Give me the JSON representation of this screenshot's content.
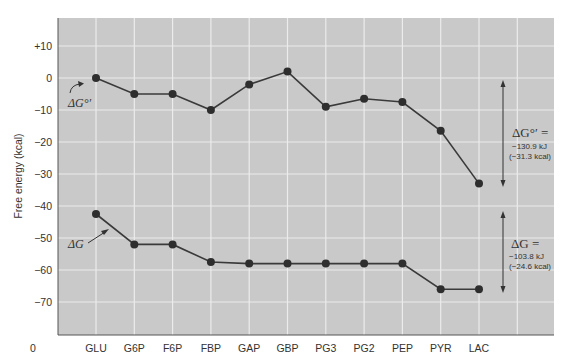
{
  "chart_data": {
    "type": "line",
    "title": "",
    "xlabel": "",
    "ylabel": "Free energy (kcal)",
    "origin_label": "0",
    "categories": [
      "GLU",
      "G6P",
      "F6P",
      "FBP",
      "GAP",
      "GBP",
      "PG3",
      "PG2",
      "PEP",
      "PYR",
      "LAC"
    ],
    "yticks": [
      {
        "value": 10,
        "label": "+10"
      },
      {
        "value": 0,
        "label": "0"
      },
      {
        "value": -10,
        "label": "−10"
      },
      {
        "value": -20,
        "label": "−20"
      },
      {
        "value": -30,
        "label": "−30"
      },
      {
        "value": -40,
        "label": "−40"
      },
      {
        "value": -50,
        "label": "−50"
      },
      {
        "value": -60,
        "label": "−60"
      },
      {
        "value": -70,
        "label": "−70"
      }
    ],
    "ylim": [
      -80,
      19
    ],
    "grid": true,
    "series": [
      {
        "name": "ΔG°′",
        "values": [
          0,
          -5,
          -5,
          -10,
          -2,
          2,
          -9,
          -6.5,
          -7.5,
          -16.5,
          -33
        ]
      },
      {
        "name": "ΔG",
        "values": [
          -42.5,
          -52,
          -52,
          -57.5,
          -58,
          -58,
          -58,
          -58,
          -58,
          -66,
          -66
        ]
      }
    ],
    "annotations": [
      {
        "id": "dg0",
        "symbol": "ΔG°′ =",
        "line1": "−130.9 kJ",
        "line2": "(−31.3 kcal)",
        "from": 0,
        "to": -33
      },
      {
        "id": "dg",
        "symbol": "ΔG =",
        "line1": "−103.8 kJ",
        "line2": "(−24.6 kcal)",
        "from": -42.5,
        "to": -66
      }
    ],
    "series_labels": {
      "dg0": "ΔG°′",
      "dg": "ΔG"
    }
  },
  "style": {
    "plot_bg": "#c9c9c9",
    "grid_color": "#ececec",
    "line_color": "#3a3a3a",
    "marker_color": "#2e2e2e",
    "axis_color": "#555555"
  }
}
